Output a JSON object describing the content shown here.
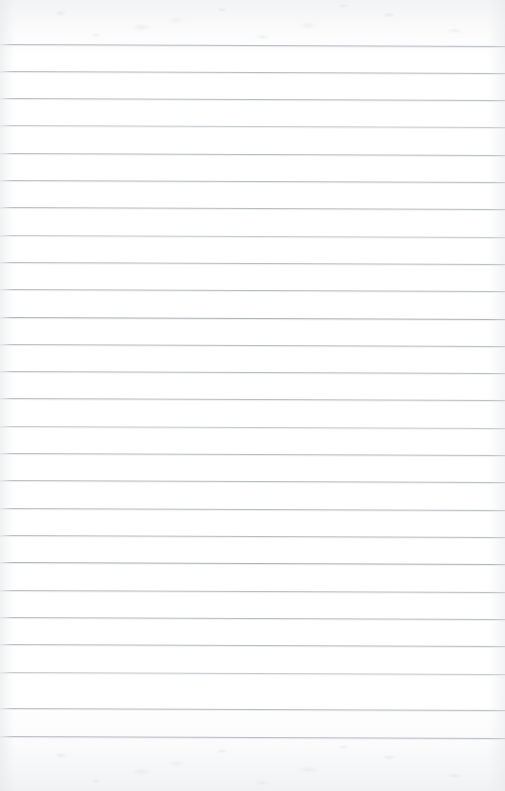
{
  "document": {
    "kind": "scanned-lined-paper",
    "title": "Blank ruled notepad page",
    "page_width": 505,
    "page_height": 791,
    "text_content": "",
    "handwriting_present": "no",
    "printed_text_present": "no"
  },
  "paper": {
    "background_color": "#fdfdfd",
    "top_margin_tint": "#f2f3f4",
    "bottom_margin_tint": "#f1f2f3",
    "edge_shadow_color": "#e4e6e8",
    "texture": "faint mottled scanner noise in top and bottom margins"
  },
  "ruling": {
    "line_color": "#b9bcc0",
    "line_color_light": "#c6c9cd",
    "line_color_dark": "#aeb1b6",
    "line_thickness_px": 1,
    "line_count": 26,
    "first_line_y": 44,
    "line_spacing_px": 27.3,
    "last_line_y": 736,
    "line_start_x": 0,
    "line_end_x": 505,
    "tilt_degrees": 0.23,
    "margin_rule": "none",
    "lines": [
      {
        "index": 1,
        "y": 44,
        "weight": "normal"
      },
      {
        "index": 2,
        "y": 71,
        "weight": "normal"
      },
      {
        "index": 3,
        "y": 98,
        "weight": "normal"
      },
      {
        "index": 4,
        "y": 125,
        "weight": "light"
      },
      {
        "index": 5,
        "y": 153,
        "weight": "normal"
      },
      {
        "index": 6,
        "y": 180,
        "weight": "normal"
      },
      {
        "index": 7,
        "y": 207,
        "weight": "normal"
      },
      {
        "index": 8,
        "y": 235,
        "weight": "light"
      },
      {
        "index": 9,
        "y": 262,
        "weight": "normal"
      },
      {
        "index": 10,
        "y": 289,
        "weight": "normal"
      },
      {
        "index": 11,
        "y": 317,
        "weight": "dark"
      },
      {
        "index": 12,
        "y": 344,
        "weight": "normal"
      },
      {
        "index": 13,
        "y": 371,
        "weight": "normal"
      },
      {
        "index": 14,
        "y": 398,
        "weight": "normal"
      },
      {
        "index": 15,
        "y": 426,
        "weight": "light"
      },
      {
        "index": 16,
        "y": 453,
        "weight": "normal"
      },
      {
        "index": 17,
        "y": 480,
        "weight": "normal"
      },
      {
        "index": 18,
        "y": 508,
        "weight": "normal"
      },
      {
        "index": 19,
        "y": 535,
        "weight": "normal"
      },
      {
        "index": 20,
        "y": 562,
        "weight": "dark"
      },
      {
        "index": 21,
        "y": 590,
        "weight": "normal"
      },
      {
        "index": 22,
        "y": 617,
        "weight": "normal"
      },
      {
        "index": 23,
        "y": 644,
        "weight": "normal"
      },
      {
        "index": 24,
        "y": 672,
        "weight": "light"
      },
      {
        "index": 25,
        "y": 708,
        "weight": "normal"
      },
      {
        "index": 26,
        "y": 736,
        "weight": "normal"
      }
    ]
  }
}
